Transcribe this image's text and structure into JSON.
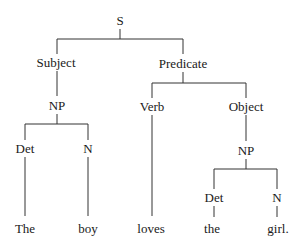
{
  "tree": {
    "root": "S",
    "subject": "Subject",
    "predicate": "Predicate",
    "subject_np": "NP",
    "verb": "Verb",
    "object": "Object",
    "object_np": "NP",
    "det1": "Det",
    "n1": "N",
    "det2": "Det",
    "n2": "N"
  },
  "sentence": {
    "words": [
      "The",
      "boy",
      "loves",
      "the",
      "girl."
    ]
  }
}
